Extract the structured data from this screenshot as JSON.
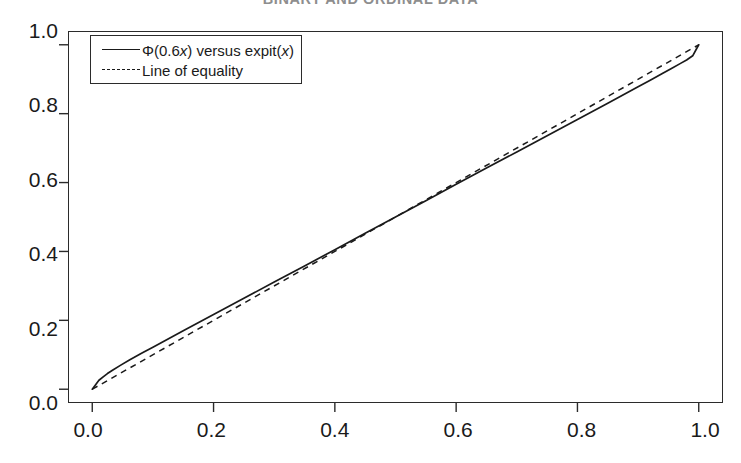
{
  "page": {
    "running_header": "BINARY AND ORDINAL DATA"
  },
  "legend": {
    "entries": [
      {
        "label": "Φ(0.6x) versus expit(x)",
        "style": "solid",
        "key_name": "solid-line-key"
      },
      {
        "label": "Line of equality",
        "style": "dashed",
        "key_name": "dashed-line-key"
      }
    ]
  },
  "axes": {
    "x_ticks": [
      "0.0",
      "0.2",
      "0.4",
      "0.6",
      "0.8",
      "1.0"
    ],
    "y_ticks": [
      "0.0",
      "0.2",
      "0.4",
      "0.6",
      "0.8",
      "1.0"
    ]
  },
  "chart_data": {
    "type": "line",
    "title": "",
    "xlabel": "",
    "ylabel": "",
    "xlim": [
      -0.04,
      1.04
    ],
    "ylim": [
      -0.04,
      1.04
    ],
    "grid": false,
    "legend_position": "top-left-inside",
    "x_ticks": [
      0.0,
      0.2,
      0.4,
      0.6,
      0.8,
      1.0
    ],
    "y_ticks": [
      0.0,
      0.2,
      0.4,
      0.6,
      0.8,
      1.0
    ],
    "series": [
      {
        "name": "Φ(0.6x) versus expit(x)",
        "style": "solid",
        "color": "#1a1a1a",
        "x": [
          0.0,
          0.011,
          0.018,
          0.025,
          0.034,
          0.047,
          0.062,
          0.082,
          0.1,
          0.15,
          0.2,
          0.25,
          0.3,
          0.35,
          0.4,
          0.45,
          0.5,
          0.55,
          0.6,
          0.65,
          0.7,
          0.75,
          0.8,
          0.85,
          0.9,
          0.92,
          0.94,
          0.955,
          0.97,
          0.98,
          0.99,
          1.0
        ],
        "y": [
          0.0,
          0.026,
          0.036,
          0.0455,
          0.056,
          0.07,
          0.0855,
          0.105,
          0.122,
          0.17,
          0.217,
          0.264,
          0.311,
          0.358,
          0.405,
          0.453,
          0.5,
          0.547,
          0.595,
          0.642,
          0.689,
          0.736,
          0.783,
          0.83,
          0.878,
          0.897,
          0.9165,
          0.931,
          0.946,
          0.956,
          0.968,
          1.0
        ]
      },
      {
        "name": "Line of equality",
        "style": "dashed",
        "color": "#1a1a1a",
        "x": [
          0.0,
          1.0
        ],
        "y": [
          0.0,
          1.0
        ]
      }
    ]
  }
}
